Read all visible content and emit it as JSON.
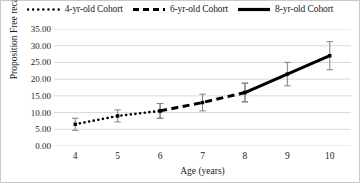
{
  "chart_data": {
    "type": "line",
    "title": "",
    "xlabel": "Age (years)",
    "ylabel": "Proposition Free recall",
    "x": [
      4,
      5,
      6,
      7,
      8,
      9,
      10
    ],
    "xlim": [
      3.5,
      10.5
    ],
    "ylim": [
      0,
      35
    ],
    "ytick_labels": [
      "0.00",
      "5.00",
      "10.00",
      "15.00",
      "20.00",
      "25.00",
      "30.00",
      "35.00"
    ],
    "ytick_values": [
      0,
      5,
      10,
      15,
      20,
      25,
      30,
      35
    ],
    "xtick_labels": [
      "4",
      "5",
      "6",
      "7",
      "8",
      "9",
      "10"
    ],
    "grid": "horizontal",
    "legend_position": "top",
    "series": [
      {
        "name": "4-yr-old Cohort",
        "style": "dotted",
        "color": "#000000",
        "x": [
          4,
          5,
          6
        ],
        "values": [
          6.5,
          9.0,
          10.5
        ],
        "errors": [
          1.8,
          1.8,
          2.2
        ]
      },
      {
        "name": "6-yr-old Cohort",
        "style": "dashed",
        "color": "#000000",
        "x": [
          6,
          7,
          8
        ],
        "values": [
          10.5,
          13.0,
          16.0
        ],
        "errors": [
          2.2,
          2.5,
          2.8
        ]
      },
      {
        "name": "8-yr-old Cohort",
        "style": "solid",
        "color": "#000000",
        "x": [
          8,
          9,
          10
        ],
        "values": [
          16.0,
          21.5,
          27.0
        ],
        "errors": [
          2.8,
          3.5,
          4.2
        ]
      }
    ]
  },
  "legend": {
    "items": [
      {
        "label": "4-yr-old Cohort",
        "style": "dotted"
      },
      {
        "label": "6-yr-old Cohort",
        "style": "dashed"
      },
      {
        "label": "8-yr-old Cohort",
        "style": "solid"
      }
    ]
  },
  "colors": {
    "line": "#000000",
    "grid": "#d9d9d9",
    "text": "#1a1a1a",
    "border": "#c9c9c9",
    "background": "#ffffff"
  }
}
